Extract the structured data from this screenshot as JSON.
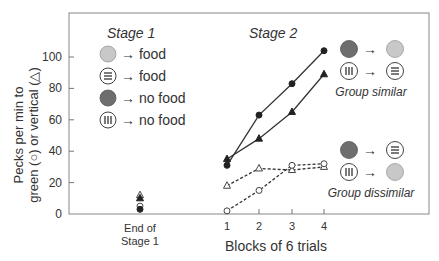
{
  "chart_data": {
    "type": "line",
    "title": "",
    "ylabel": "Pecks per min to green (○) or vertical (△)",
    "ylabel_line1": "Pecks per min to",
    "ylabel_line2": "green (○) or vertical (△)",
    "xlabel": "Blocks of 6 trials",
    "ylim": [
      0,
      110
    ],
    "yticks": [
      0,
      20,
      40,
      60,
      80,
      100
    ],
    "x_categories": [
      "End of Stage 1",
      "1",
      "2",
      "3",
      "4"
    ],
    "end_of_stage1_label_line1": "End of",
    "end_of_stage1_label_line2": "Stage 1",
    "stage1_title": "Stage 1",
    "stage2_title": "Stage 2",
    "stage1_legend": [
      {
        "symbol": "light-gray-circle",
        "text": "→ food"
      },
      {
        "symbol": "horizontal-lines-circle",
        "text": "→ food"
      },
      {
        "symbol": "dark-gray-circle",
        "text": "→ no food"
      },
      {
        "symbol": "vertical-lines-circle",
        "text": "→ no food"
      }
    ],
    "group_legends": [
      {
        "name": "Group similar",
        "rows": [
          {
            "from": "dark-gray-circle",
            "arrow": "→",
            "to": "light-gray-circle"
          },
          {
            "from": "vertical-lines-circle",
            "arrow": "→",
            "to": "horizontal-lines-circle"
          }
        ]
      },
      {
        "name": "Group dissimilar",
        "rows": [
          {
            "from": "dark-gray-circle",
            "arrow": "→",
            "to": "horizontal-lines-circle"
          },
          {
            "from": "vertical-lines-circle",
            "arrow": "→",
            "to": "light-gray-circle"
          }
        ]
      }
    ],
    "end_of_stage1_points": [
      {
        "marker": "open-triangle",
        "y": 12
      },
      {
        "marker": "filled-triangle",
        "y": 10
      },
      {
        "marker": "open-circle",
        "y": 5
      },
      {
        "marker": "filled-circle",
        "y": 3
      }
    ],
    "x": [
      1,
      2,
      3,
      4
    ],
    "series": [
      {
        "name": "Group similar – green (circle)",
        "marker": "filled-circle",
        "line": "solid",
        "values": [
          31,
          63,
          83,
          104
        ]
      },
      {
        "name": "Group similar – vertical (triangle)",
        "marker": "filled-triangle",
        "line": "solid",
        "values": [
          35,
          48,
          65,
          89
        ]
      },
      {
        "name": "Group dissimilar – vertical (triangle)",
        "marker": "open-triangle",
        "line": "dashed",
        "values": [
          18,
          29,
          28,
          30
        ]
      },
      {
        "name": "Group dissimilar – green (circle)",
        "marker": "open-circle",
        "line": "dashed",
        "values": [
          2,
          15,
          31,
          32
        ]
      }
    ],
    "grid": false,
    "colors": {
      "axis": "#777777",
      "line": "#333333",
      "light_gray_fill": "#c8c8c8",
      "dark_gray_fill": "#6e6e6e",
      "text": "#333333"
    }
  }
}
